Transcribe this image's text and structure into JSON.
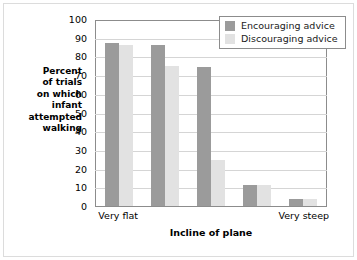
{
  "chart_data": {
    "type": "bar",
    "title": "",
    "xlabel": "Incline of plane",
    "ylabel": "Percent of trials on which infant attempted walking",
    "ylabel_lines": [
      "Percent",
      "of trials",
      "on which",
      "infant",
      "attempted",
      "walking"
    ],
    "categories": [
      "Very flat",
      "",
      "",
      "",
      "Very steep"
    ],
    "xtick_labels": [
      "Very flat",
      "Very steep"
    ],
    "series": [
      {
        "name": "Encouraging advice",
        "values": [
          88,
          87,
          75,
          11.5,
          4
        ],
        "color": "#9b9b9b"
      },
      {
        "name": "Discouraging advice",
        "values": [
          87,
          75.5,
          25,
          11.5,
          4
        ],
        "color": "#e2e2e2"
      }
    ],
    "ylim": [
      0,
      100
    ],
    "ytick_labels": [
      "100",
      "90",
      "80",
      "70",
      "60",
      "50",
      "40",
      "30",
      "20",
      "10",
      "0"
    ],
    "ytick_values": [
      100,
      90,
      80,
      70,
      60,
      50,
      40,
      30,
      20,
      10,
      0
    ],
    "ytick_step": 10,
    "grid": true,
    "legend": {
      "position": "top-right",
      "entries": [
        "Encouraging advice",
        "Discouraging advice"
      ]
    },
    "colors": {
      "encouraging": "#9b9b9b",
      "discouraging": "#e2e2e2",
      "gridline": "#d5d5d5",
      "axis": "#8c8c8c",
      "text": "#000000",
      "background": "#ffffff"
    }
  }
}
